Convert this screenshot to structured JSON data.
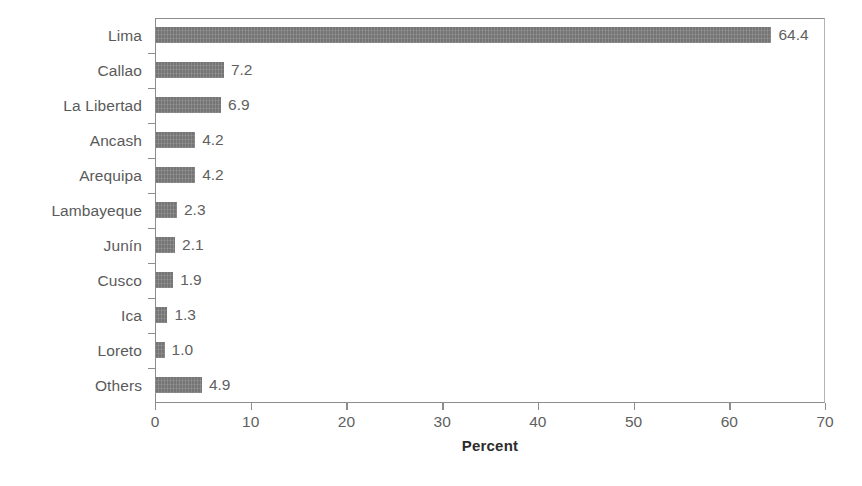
{
  "chart_data": {
    "type": "bar",
    "orientation": "horizontal",
    "title": "",
    "xlabel": "Percent",
    "ylabel": "",
    "xlim": [
      0,
      70
    ],
    "xticks": [
      0,
      10,
      20,
      30,
      40,
      50,
      60,
      70
    ],
    "xtick_labels": [
      "0",
      "10",
      "20",
      "30",
      "40",
      "50",
      "60",
      "70"
    ],
    "grid": false,
    "legend": null,
    "bar_color": "#757575",
    "categories": [
      "Lima",
      "Callao",
      "La Libertad",
      "Ancash",
      "Arequipa",
      "Lambayeque",
      "Junín",
      "Cusco",
      "Ica",
      "Loreto",
      "Others"
    ],
    "values": [
      64.4,
      7.2,
      6.9,
      4.2,
      4.2,
      2.3,
      2.1,
      1.9,
      1.3,
      1.0,
      4.9
    ],
    "value_labels": [
      "64.4",
      "7.2",
      "6.9",
      "4.2",
      "4.2",
      "2.3",
      "2.1",
      "1.9",
      "1.3",
      "1.0",
      "4.9"
    ]
  }
}
